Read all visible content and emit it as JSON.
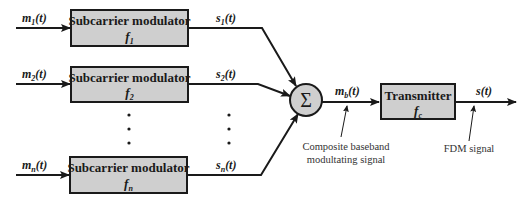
{
  "diagram": {
    "type": "block-diagram",
    "modulators": [
      {
        "title": "Subcarrier modulator",
        "freq_base": "f",
        "freq_sub": "1",
        "input_base": "m",
        "input_sub": "1",
        "output_base": "s",
        "output_sub": "1"
      },
      {
        "title": "Subcarrier modulator",
        "freq_base": "f",
        "freq_sub": "2",
        "input_base": "m",
        "input_sub": "2",
        "output_base": "s",
        "output_sub": "2"
      },
      {
        "title": "Subcarrier modulator",
        "freq_base": "f",
        "freq_sub": "n",
        "input_base": "m",
        "input_sub": "n",
        "output_base": "s",
        "output_sub": "n"
      }
    ],
    "time_arg": "(t)",
    "summer": {
      "symbol": "Σ"
    },
    "composite": {
      "label_base": "m",
      "label_sub": "b",
      "caption_line1": "Composite baseband",
      "caption_line2": "modultating signal"
    },
    "transmitter": {
      "title": "Transmitter",
      "freq_base": "f",
      "freq_sub": "c"
    },
    "output": {
      "label": "s(t)",
      "caption": "FDM signal"
    },
    "ellipsis": "⋮",
    "colors": {
      "box_fill": "#cfcfcf",
      "stroke": "#1a1a1a",
      "background": "#ffffff"
    }
  }
}
